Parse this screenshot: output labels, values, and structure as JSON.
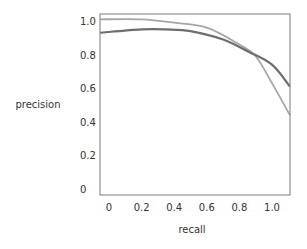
{
  "chart_data": {
    "type": "line",
    "title": "",
    "xlabel": "recall",
    "ylabel": "precision",
    "xlim": [
      -0.055,
      1.11
    ],
    "ylim": [
      -0.036,
      1.04
    ],
    "grid": false,
    "legend": null,
    "x_ticks": [
      0,
      0.2,
      0.4,
      0.6,
      0.8,
      1.0
    ],
    "x_tick_labels": [
      "0",
      "0.2",
      "0.4",
      "0.6",
      "0.8",
      "1.0"
    ],
    "y_ticks": [
      0,
      0.2,
      0.4,
      0.6,
      0.8,
      1.0
    ],
    "y_tick_labels": [
      "0",
      "0.2",
      "0.4",
      "0.6",
      "0.8",
      "1.0"
    ],
    "series": [
      {
        "name": "curve-light",
        "color": "#a6a6a6",
        "x": [
          -0.055,
          0.2,
          0.4,
          0.6,
          0.8,
          0.9,
          1.0,
          1.11
        ],
        "y": [
          1.01,
          1.01,
          0.99,
          0.96,
          0.86,
          0.79,
          0.63,
          0.44
        ]
      },
      {
        "name": "curve-dark",
        "color": "#6e6e6e",
        "x": [
          -0.055,
          0.2,
          0.35,
          0.5,
          0.7,
          0.85,
          1.0,
          1.11
        ],
        "y": [
          0.93,
          0.95,
          0.95,
          0.94,
          0.89,
          0.82,
          0.74,
          0.61
        ]
      }
    ]
  },
  "layout": {
    "plot_left": 100,
    "plot_right": 290,
    "plot_top": 14,
    "plot_bottom": 195,
    "x0_px": 109,
    "x1_px": 272,
    "y0_px": 189,
    "y1_px": 21
  }
}
